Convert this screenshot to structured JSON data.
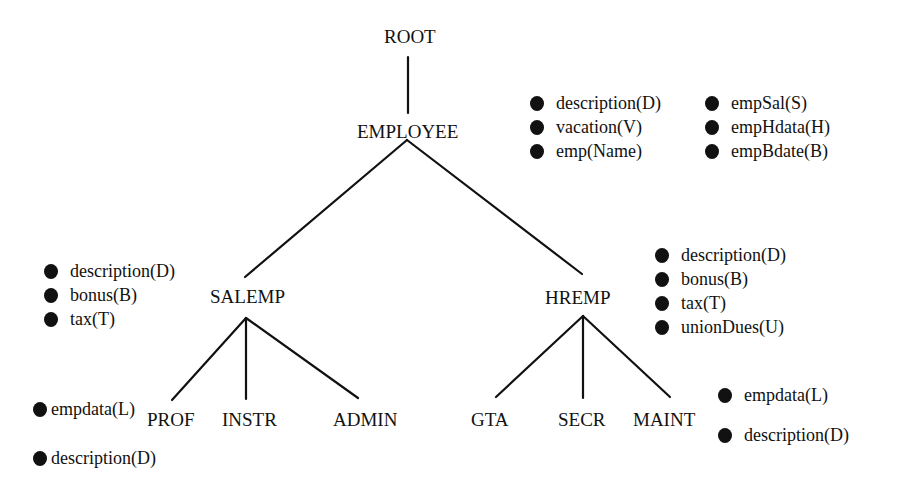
{
  "diagram": {
    "type": "class-hierarchy-tree",
    "nodes": {
      "root": "ROOT",
      "employee": "EMPLOYEE",
      "salemp": "SALEMP",
      "hremp": "HREMP",
      "prof": "PROF",
      "instr": "INSTR",
      "admin": "ADMIN",
      "gta": "GTA",
      "secr": "SECR",
      "maint": "MAINT"
    },
    "edges": [
      [
        "ROOT",
        "EMPLOYEE"
      ],
      [
        "EMPLOYEE",
        "SALEMP"
      ],
      [
        "EMPLOYEE",
        "HREMP"
      ],
      [
        "SALEMP",
        "PROF"
      ],
      [
        "SALEMP",
        "INSTR"
      ],
      [
        "SALEMP",
        "ADMIN"
      ],
      [
        "HREMP",
        "GTA"
      ],
      [
        "HREMP",
        "SECR"
      ],
      [
        "HREMP",
        "MAINT"
      ]
    ],
    "attributes": {
      "employee_col1": [
        "description(D)",
        "vacation(V)",
        "emp(Name)"
      ],
      "employee_col2": [
        "empSal(S)",
        "empHdata(H)",
        "empBdate(B)"
      ],
      "salemp": [
        "description(D)",
        "bonus(B)",
        "tax(T)"
      ],
      "hremp": [
        "description(D)",
        "bonus(B)",
        "tax(T)",
        "unionDues(U)"
      ],
      "prof": [
        "empdata(L)",
        "description(D)"
      ],
      "maint": [
        "empdata(L)",
        "description(D)"
      ]
    },
    "colors": {
      "ink": "#111111",
      "background": "#ffffff"
    }
  }
}
